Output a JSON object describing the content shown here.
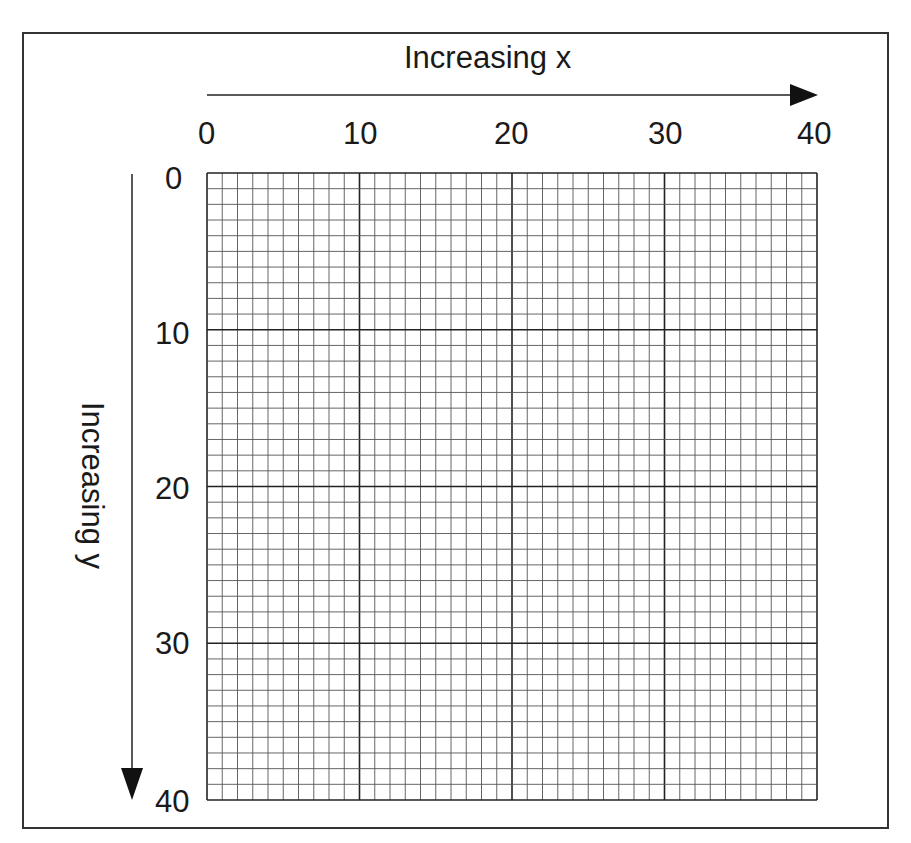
{
  "diagram": {
    "x_axis": {
      "title": "Increasing x",
      "ticks": [
        "0",
        "10",
        "20",
        "30",
        "40"
      ],
      "direction": "left-to-right"
    },
    "y_axis": {
      "title": "Increasing y",
      "ticks": [
        "0",
        "10",
        "20",
        "30",
        "40"
      ],
      "direction": "top-to-bottom"
    },
    "grid": {
      "range_x": [
        0,
        40
      ],
      "range_y": [
        0,
        40
      ],
      "minor_step": 1,
      "major_step": 10
    },
    "colors": {
      "line": "#333333",
      "background": "#ffffff"
    }
  }
}
